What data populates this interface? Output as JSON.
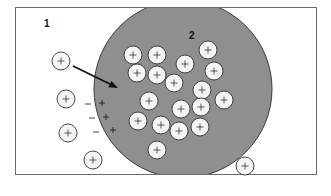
{
  "diagram": {
    "region_labels": {
      "outside": "1",
      "inside": "2"
    },
    "colors": {
      "background": "#ffffff",
      "frame": "#6a6a6a",
      "cell_fill": "#8f8f8f",
      "cell_stroke": "#3a3a3a",
      "ion_fill": "#f4f4f4",
      "ion_stroke": "#333333"
    },
    "cell": {
      "cx": 183,
      "cy": 89,
      "r": 89
    },
    "ion_symbol": "+",
    "ion_radius": 9,
    "ions_inside": [
      [
        133,
        55
      ],
      [
        157,
        55
      ],
      [
        137,
        73
      ],
      [
        157,
        75
      ],
      [
        185,
        64
      ],
      [
        208,
        50
      ],
      [
        214,
        71
      ],
      [
        174,
        83
      ],
      [
        202,
        90
      ],
      [
        224,
        100
      ],
      [
        149,
        101
      ],
      [
        181,
        109
      ],
      [
        201,
        107
      ],
      [
        138,
        121
      ],
      [
        161,
        125
      ],
      [
        200,
        127
      ],
      [
        179,
        131
      ],
      [
        157,
        150
      ]
    ],
    "ions_outside": [
      [
        61,
        61
      ],
      [
        66,
        99
      ],
      [
        68,
        133
      ],
      [
        93,
        160
      ],
      [
        245,
        166
      ]
    ],
    "membrane_charges": {
      "negative_outside": [
        [
          88,
          104
        ],
        [
          92,
          118
        ],
        [
          96,
          132
        ]
      ],
      "positive_inside": [
        [
          102,
          103
        ],
        [
          106,
          117
        ],
        [
          113,
          130
        ]
      ]
    },
    "arrow": {
      "from": [
        73,
        66
      ],
      "to": [
        118,
        88
      ]
    }
  }
}
